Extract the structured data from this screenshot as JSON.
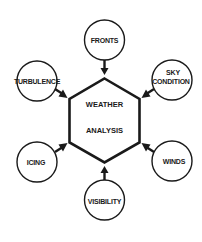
{
  "diagram": {
    "title": "Weather Analysis",
    "center": {
      "shape": "hexagon",
      "line1": "WEATHER",
      "line2": "ANALYSIS"
    },
    "nodes": [
      {
        "id": "fronts",
        "label": "FRONTS",
        "position": "top"
      },
      {
        "id": "sky-condition",
        "label_line1": "SKY",
        "label_line2": "CONDITION",
        "position": "upper-right"
      },
      {
        "id": "winds",
        "label": "WINDS",
        "position": "lower-right"
      },
      {
        "id": "visibility",
        "label": "VISIBILITY",
        "position": "bottom"
      },
      {
        "id": "icing",
        "label": "ICING",
        "position": "lower-left"
      },
      {
        "id": "turbulence",
        "label": "TURBULENCE",
        "position": "upper-left"
      }
    ],
    "edges": [
      {
        "from": "fronts",
        "to": "center"
      },
      {
        "from": "sky-condition",
        "to": "center"
      },
      {
        "from": "winds",
        "to": "center"
      },
      {
        "from": "visibility",
        "to": "center"
      },
      {
        "from": "icing",
        "to": "center"
      },
      {
        "from": "turbulence",
        "to": "center"
      }
    ],
    "colors": {
      "stroke": "#1a1a1a",
      "background": "#ffffff"
    }
  }
}
